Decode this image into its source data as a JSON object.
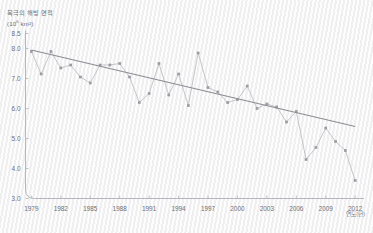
{
  "chart_data": {
    "type": "line",
    "title": "북극의 해빙 면적",
    "unit_label_prefix": "(10",
    "unit_label_sup": "6",
    "unit_label_suffix": " km²)",
    "xlabel": "연도(년)",
    "ylabel": "",
    "xlim": [
      1978.4,
      2012.9
    ],
    "ylim": [
      3.0,
      8.5
    ],
    "xticks": [
      1979,
      1982,
      1985,
      1988,
      1991,
      1994,
      1997,
      2000,
      2003,
      2006,
      2009,
      2012
    ],
    "yticks": [
      3.0,
      4.0,
      5.0,
      6.0,
      7.0,
      8.0,
      8.5
    ],
    "ytick_labels": [
      "3.0",
      "4.0",
      "5.0",
      "6.0",
      "7.0",
      "8.0",
      "8.5"
    ],
    "grid": false,
    "legend": "none",
    "series": [
      {
        "name": "해빙 면적",
        "color": "#b9b9bf",
        "marker": "square",
        "x": [
          1979,
          1980,
          1981,
          1982,
          1983,
          1984,
          1985,
          1986,
          1987,
          1988,
          1989,
          1990,
          1991,
          1992,
          1993,
          1994,
          1995,
          1996,
          1997,
          1998,
          1999,
          2000,
          2001,
          2002,
          2003,
          2004,
          2005,
          2006,
          2007,
          2008,
          2009,
          2010,
          2011,
          2012
        ],
        "values": [
          7.9,
          7.15,
          7.9,
          7.35,
          7.45,
          7.05,
          6.85,
          7.45,
          7.45,
          7.5,
          7.05,
          6.2,
          6.5,
          7.5,
          6.45,
          7.15,
          6.1,
          7.85,
          6.7,
          6.55,
          6.2,
          6.3,
          6.75,
          6.0,
          6.15,
          6.05,
          5.55,
          5.9,
          4.3,
          4.7,
          5.35,
          4.9,
          4.6,
          3.6
        ]
      }
    ],
    "trendline": {
      "name": "추세선",
      "color": "#8c8c93",
      "x": [
        1979,
        2012
      ],
      "values": [
        7.95,
        5.4
      ]
    }
  }
}
